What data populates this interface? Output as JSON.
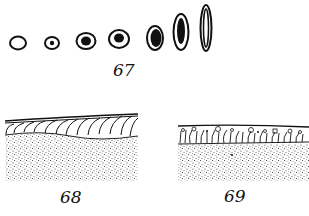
{
  "figures": [
    {
      "id": "fig-67",
      "label": "67",
      "description": "Sequence of seven oval cells, progressively elongating with darkening nuclei"
    },
    {
      "id": "fig-68",
      "label": "68",
      "description": "Tissue section with curved fibrous layer over stippled base"
    },
    {
      "id": "fig-69",
      "label": "69",
      "description": "Tissue section with columnar cells and granules over stippled base"
    }
  ],
  "colors": {
    "ink": "#111111",
    "paper": "#ffffff"
  }
}
